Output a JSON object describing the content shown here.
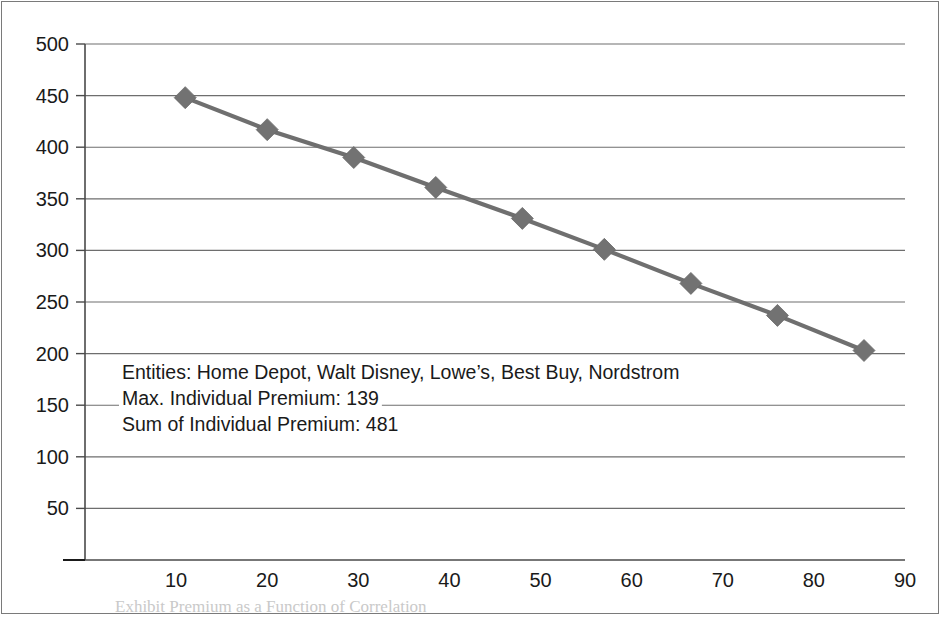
{
  "chart_data": {
    "type": "line",
    "title": "",
    "xlabel": "",
    "ylabel": "",
    "xlim": [
      0,
      90
    ],
    "ylim": [
      0,
      500
    ],
    "grid": true,
    "legend": "none",
    "marker": "diamond",
    "series_color": "#6f6f6f",
    "marker_color": "#727272",
    "x": [
      11,
      20,
      29.5,
      38.5,
      48,
      57,
      66.5,
      76,
      85.5
    ],
    "values": [
      448,
      417,
      390,
      361,
      331,
      301,
      268,
      237,
      203
    ],
    "y_ticks": [
      {
        "value": 0,
        "label": "–"
      },
      {
        "value": 50,
        "label": "50"
      },
      {
        "value": 100,
        "label": "100"
      },
      {
        "value": 150,
        "label": "150"
      },
      {
        "value": 200,
        "label": "200"
      },
      {
        "value": 250,
        "label": "250"
      },
      {
        "value": 300,
        "label": "300"
      },
      {
        "value": 350,
        "label": "350"
      },
      {
        "value": 400,
        "label": "400"
      },
      {
        "value": 450,
        "label": "450"
      },
      {
        "value": 500,
        "label": "500"
      }
    ],
    "x_ticks": [
      {
        "value": 10,
        "label": "10"
      },
      {
        "value": 20,
        "label": "20"
      },
      {
        "value": 30,
        "label": "30"
      },
      {
        "value": 40,
        "label": "40"
      },
      {
        "value": 50,
        "label": "50"
      },
      {
        "value": 60,
        "label": "60"
      },
      {
        "value": 70,
        "label": "70"
      },
      {
        "value": 80,
        "label": "80"
      },
      {
        "value": 90,
        "label": "90"
      }
    ],
    "annotations": [
      "Entities: Home Depot, Walt Disney, Lowe’s, Best Buy, Nordstrom",
      "Max. Individual Premium: 139",
      "Sum of Individual Premium: 481"
    ]
  },
  "caption": {
    "text": "Exhibit   Premium as a Function of Correlation"
  }
}
